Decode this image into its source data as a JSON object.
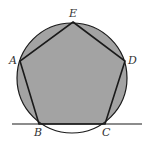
{
  "diagram": {
    "type": "geometry",
    "colors": {
      "fill": "#a3a3a3",
      "stroke": "#1a1a1a",
      "background": "#ffffff"
    },
    "circle": {
      "cx": 72,
      "cy": 78,
      "r": 55
    },
    "vertices": {
      "A": {
        "x": 20,
        "y": 61,
        "label": "A"
      },
      "B": {
        "x": 39,
        "y": 124,
        "label": "B"
      },
      "C": {
        "x": 105,
        "y": 124,
        "label": "C"
      },
      "D": {
        "x": 125,
        "y": 61,
        "label": "D"
      },
      "E": {
        "x": 73,
        "y": 22,
        "label": "E"
      }
    },
    "line": {
      "x1": 12,
      "y1": 124,
      "x2": 142,
      "y2": 124
    },
    "labels": [
      "E",
      "A",
      "D",
      "B",
      "C"
    ]
  }
}
